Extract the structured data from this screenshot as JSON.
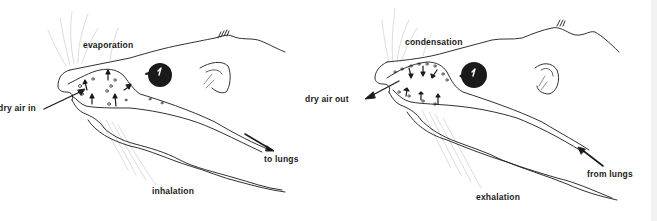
{
  "figure": {
    "panels": [
      {
        "id": "inhalation",
        "title": "inhalation",
        "labels": {
          "process": "evaporation",
          "air": "dry air in",
          "lungs": "to lungs"
        }
      },
      {
        "id": "exhalation",
        "title": "exhalation",
        "labels": {
          "process": "condensation",
          "air": "dry air out",
          "lungs": "from lungs"
        }
      }
    ],
    "colors": {
      "ink": "#1a1a1a",
      "background": "#ffffff",
      "whisker": "#bdbdbd"
    }
  }
}
